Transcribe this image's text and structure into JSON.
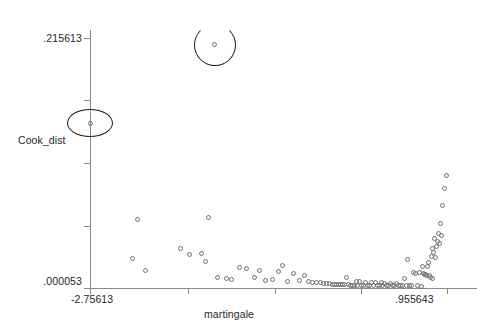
{
  "chart_data": {
    "type": "scatter",
    "title": "",
    "xlabel": "martingale",
    "ylabel": "Cook_dist",
    "xlim": [
      -2.75613,
      0.955643
    ],
    "ylim": [
      5.3e-05,
      0.215613
    ],
    "xticklabels": [
      "-2.75613",
      ".955643"
    ],
    "yticklabels": [
      ".215613",
      ".000053"
    ],
    "grid": false,
    "legend": null,
    "marker": "open-circle",
    "points": [
      [
        -2.75613,
        0.142
      ],
      [
        -1.46,
        0.21
      ],
      [
        -2.26,
        0.0595
      ],
      [
        -1.52,
        0.061
      ],
      [
        -2.31,
        0.0255
      ],
      [
        -2.18,
        0.015
      ],
      [
        -1.82,
        0.0345
      ],
      [
        -1.72,
        0.029
      ],
      [
        -1.6,
        0.0295
      ],
      [
        -1.56,
        0.0225
      ],
      [
        -1.43,
        0.009
      ],
      [
        -1.34,
        0.0082
      ],
      [
        -1.28,
        0.0076
      ],
      [
        -1.2,
        0.018
      ],
      [
        -1.13,
        0.017
      ],
      [
        -1.05,
        0.0088
      ],
      [
        -0.99,
        0.0155
      ],
      [
        -0.93,
        0.0064
      ],
      [
        -0.86,
        0.007
      ],
      [
        -0.8,
        0.014
      ],
      [
        -0.75,
        0.0195
      ],
      [
        -0.7,
        0.0058
      ],
      [
        -0.64,
        0.0125
      ],
      [
        -0.58,
        0.0062
      ],
      [
        -0.53,
        0.011
      ],
      [
        -0.48,
        0.0056
      ],
      [
        -0.44,
        0.0052
      ],
      [
        -0.4,
        0.0048
      ],
      [
        -0.36,
        0.0044
      ],
      [
        -0.33,
        0.004
      ],
      [
        -0.3,
        0.0038
      ],
      [
        -0.27,
        0.0036
      ],
      [
        -0.24,
        0.0034
      ],
      [
        -0.21,
        0.0033
      ],
      [
        -0.19,
        0.0031
      ],
      [
        -0.17,
        0.003
      ],
      [
        -0.15,
        0.0029
      ],
      [
        -0.13,
        0.0028
      ],
      [
        -0.11,
        0.0027
      ],
      [
        -0.09,
        0.009
      ],
      [
        -0.07,
        0.00265
      ],
      [
        -0.05,
        0.0026
      ],
      [
        -0.03,
        0.00255
      ],
      [
        -0.01,
        0.0025
      ],
      [
        0.01,
        0.006
      ],
      [
        0.03,
        0.0025
      ],
      [
        0.05,
        0.0058
      ],
      [
        0.07,
        0.00245
      ],
      [
        0.09,
        0.0024
      ],
      [
        0.11,
        0.0052
      ],
      [
        0.13,
        0.0024
      ],
      [
        0.15,
        0.00235
      ],
      [
        0.17,
        0.0049
      ],
      [
        0.19,
        0.0023
      ],
      [
        0.21,
        0.0046
      ],
      [
        0.23,
        0.0023
      ],
      [
        0.25,
        0.00225
      ],
      [
        0.27,
        0.0044
      ],
      [
        0.29,
        0.0022
      ],
      [
        0.31,
        0.0042
      ],
      [
        0.33,
        0.0022
      ],
      [
        0.35,
        0.00215
      ],
      [
        0.37,
        0.004
      ],
      [
        0.39,
        0.0021
      ],
      [
        0.41,
        0.00205
      ],
      [
        0.43,
        0.0038
      ],
      [
        0.45,
        0.002
      ],
      [
        0.47,
        0.00195
      ],
      [
        0.49,
        0.0019
      ],
      [
        0.51,
        0.008
      ],
      [
        0.53,
        0.0019
      ],
      [
        0.55,
        0.025
      ],
      [
        0.57,
        0.00185
      ],
      [
        0.59,
        0.0018
      ],
      [
        0.61,
        0.0135
      ],
      [
        0.63,
        0.0125
      ],
      [
        0.65,
        0.0018
      ],
      [
        0.67,
        0.013
      ],
      [
        0.69,
        0.00175
      ],
      [
        0.7,
        0.019
      ],
      [
        0.71,
        0.0125
      ],
      [
        0.72,
        0.012
      ],
      [
        0.73,
        0.0115
      ],
      [
        0.74,
        0.011
      ],
      [
        0.75,
        0.019
      ],
      [
        0.76,
        0.022
      ],
      [
        0.77,
        0.0105
      ],
      [
        0.78,
        0.009
      ],
      [
        0.79,
        0.027
      ],
      [
        0.8,
        0.0085
      ],
      [
        0.81,
        0.034
      ],
      [
        0.82,
        0.031
      ],
      [
        0.83,
        0.043
      ],
      [
        0.84,
        0.026
      ],
      [
        0.85,
        0.036
      ],
      [
        0.86,
        0.04
      ],
      [
        0.87,
        0.047
      ],
      [
        0.88,
        0.038
      ],
      [
        0.89,
        0.056
      ],
      [
        0.9,
        0.045
      ],
      [
        0.91,
        0.071
      ],
      [
        0.93,
        0.086
      ],
      [
        0.95564,
        0.097
      ]
    ],
    "annotations": [
      {
        "label": "outlier-circle-high",
        "x": -1.46,
        "y": 0.21,
        "shape": "circle"
      },
      {
        "label": "outlier-circle-left",
        "x": -2.75613,
        "y": 0.142,
        "shape": "ellipse"
      }
    ]
  },
  "axes": {
    "y_max_label": ".215613",
    "y_min_label": ".000053",
    "y_title": "Cook_dist",
    "x_min_label": "-2.75613",
    "x_max_label": ".955643",
    "x_title": "martingale"
  }
}
